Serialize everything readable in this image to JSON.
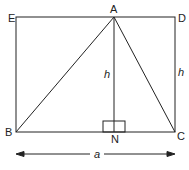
{
  "diagram": {
    "points": {
      "A": "A",
      "B": "B",
      "C": "C",
      "D": "D",
      "E": "E",
      "N": "N"
    },
    "labels": {
      "altitude": "h",
      "side": "h",
      "base": "a"
    },
    "stroke_color": "#222222"
  }
}
